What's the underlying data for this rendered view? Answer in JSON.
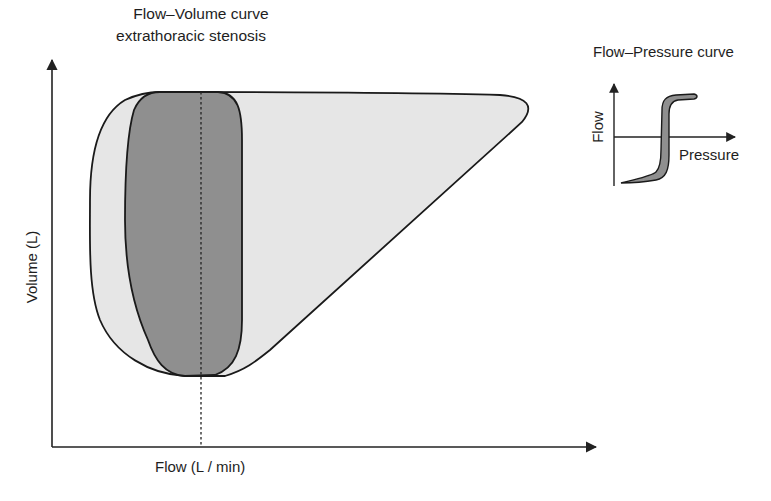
{
  "main_chart": {
    "title_line1": "Flow–Volume curve",
    "title_line2": "extrathoracic stenosis",
    "xlabel": "Flow (L / min)",
    "ylabel": "Volume (L)"
  },
  "inset": {
    "title": "Flow–Pressure curve",
    "xlabel": "Pressure",
    "ylabel": "Flow"
  },
  "colors": {
    "normal_loop_fill": "#e6e6e6",
    "stenosis_loop_fill": "#8f8f8f",
    "outline": "#1a1a1a",
    "axis": "#222222"
  },
  "shapes": {
    "normal_loop": "Normal flow-volume loop (light grey) with expiratory peak to the right",
    "stenosis_loop": "Flattened box-shaped loop (dark grey) indicating fixed extrathoracic stenosis",
    "zero_flow_line": "Dashed vertical line at zero flow"
  }
}
